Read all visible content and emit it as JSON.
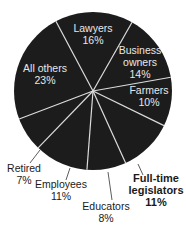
{
  "chart_data": {
    "type": "pie",
    "title": "",
    "categories": [
      "Lawyers",
      "Business owners",
      "Farmers",
      "Full-time legislators",
      "Educators",
      "Employees",
      "Retired",
      "All others"
    ],
    "values": [
      16,
      14,
      10,
      11,
      8,
      11,
      7,
      23
    ],
    "unit": "%",
    "colors": {
      "slice": "#1c1c1c",
      "divider": "#e0e0e0",
      "label_inside": "#e8e8e8",
      "label_outside": "#1a1a1a"
    },
    "labels": [
      {
        "name": "Lawyers",
        "value": "16%"
      },
      {
        "name": "Business owners",
        "line1": "Business",
        "line2": "owners",
        "value": "14%"
      },
      {
        "name": "Farmers",
        "value": "10%"
      },
      {
        "name": "Full-time legislators",
        "line1": "Full-time",
        "line2": "legislators",
        "value": "11%",
        "emphasis": "bold"
      },
      {
        "name": "Educators",
        "value": "8%"
      },
      {
        "name": "Employees",
        "value": "11%"
      },
      {
        "name": "Retired",
        "value": "7%"
      },
      {
        "name": "All others",
        "value": "23%"
      }
    ]
  }
}
